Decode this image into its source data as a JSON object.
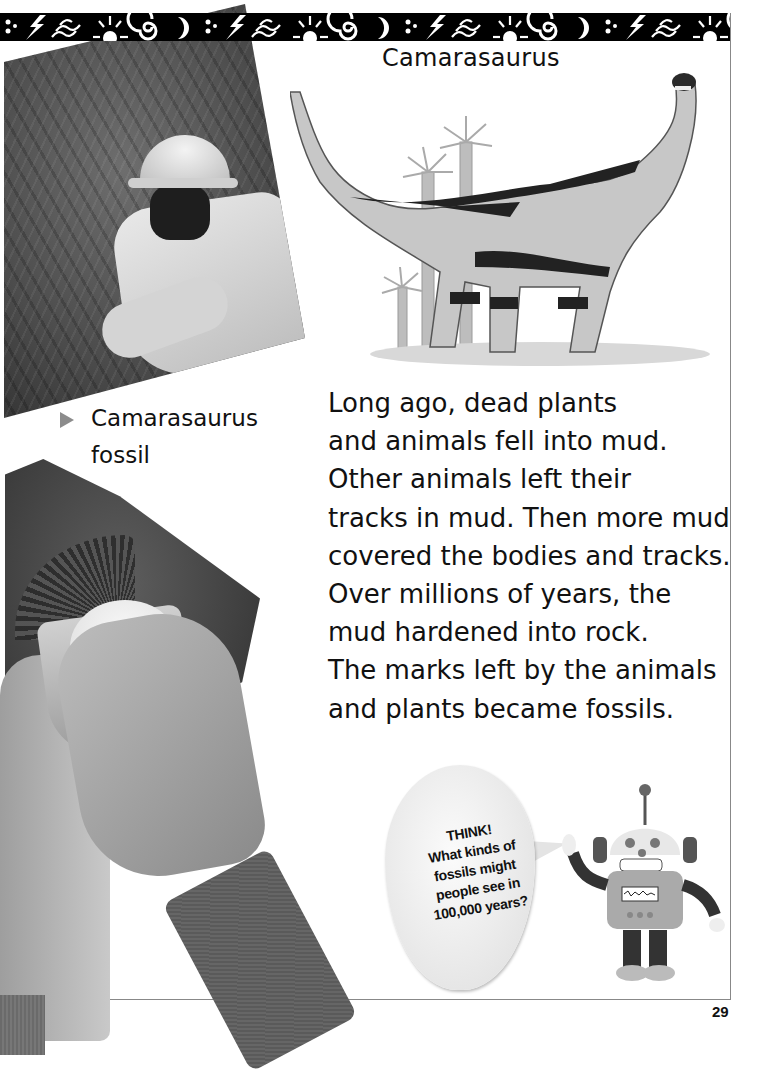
{
  "page": {
    "number": "29",
    "band_pattern": [
      "dots-icon",
      "lightning-icon",
      "waves-icon",
      "sun-icon",
      "spiral-icon",
      "moon-icon"
    ],
    "colors": {
      "band": "#000000",
      "frame": "#888888",
      "caption_marker": "#8c8c8c",
      "text": "#111111"
    }
  },
  "dinosaur": {
    "title": "Camarasaurus"
  },
  "photo_caption": {
    "lines": [
      "Camarasaurus",
      "fossil"
    ]
  },
  "body": {
    "lines": [
      "Long ago, dead plants",
      "and animals fell into mud.",
      "Other animals left their",
      "tracks in mud. Then more mud",
      "covered the bodies and tracks.",
      "Over millions of years, the",
      "mud hardened into rock.",
      "The marks left by the animals",
      "and plants became fossils."
    ]
  },
  "think_bubble": {
    "lines": [
      "THINK!",
      "What kinds of",
      "fossils might",
      "people see in",
      "100,000 years?"
    ]
  }
}
